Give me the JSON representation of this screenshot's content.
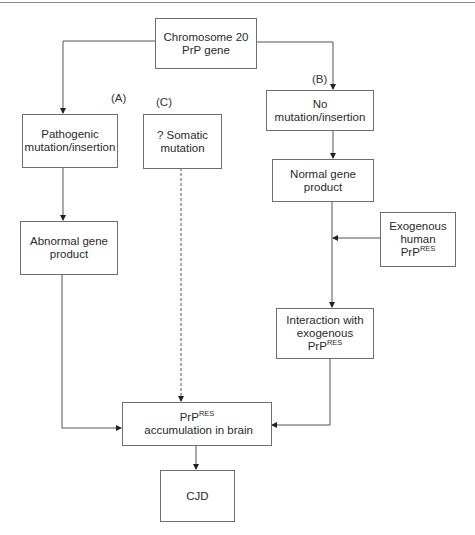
{
  "diagram": {
    "nodes": {
      "gene": {
        "line1": "Chromosome 20",
        "line2": "PrP gene"
      },
      "pathogenic": {
        "line1": "Pathogenic",
        "line2": "mutation/insertion"
      },
      "somatic": {
        "line1": "? Somatic",
        "line2": "mutation"
      },
      "no_mutation": {
        "line1": "No mutation/insertion"
      },
      "normal_product": {
        "line1": "Normal gene product"
      },
      "exogenous": {
        "line1": "Exogenous",
        "line2_prefix": "human PrP",
        "line2_sup": "RES"
      },
      "abnormal_product": {
        "line1": "Abnormal gene",
        "line2": "product"
      },
      "interaction": {
        "line1": "Interaction with",
        "line2_prefix": "exogenous PrP",
        "line2_sup": "RES"
      },
      "accumulation": {
        "prefix": "PrP",
        "sup": "RES",
        "suffix": " accumulation in brain"
      },
      "cjd": {
        "line1": "CJD"
      }
    },
    "path_labels": {
      "a": "(A)",
      "b": "(B)",
      "c": "(C)"
    },
    "edges": [
      {
        "from": "gene",
        "to": "pathogenic",
        "style": "solid"
      },
      {
        "from": "gene",
        "to": "no_mutation",
        "style": "solid"
      },
      {
        "from": "pathogenic",
        "to": "abnormal_product",
        "style": "solid"
      },
      {
        "from": "no_mutation",
        "to": "normal_product",
        "style": "solid"
      },
      {
        "from": "exogenous",
        "to": "normal_product->interaction",
        "style": "solid"
      },
      {
        "from": "normal_product",
        "to": "interaction",
        "style": "solid"
      },
      {
        "from": "abnormal_product",
        "to": "accumulation",
        "style": "solid"
      },
      {
        "from": "somatic",
        "to": "accumulation",
        "style": "dashed"
      },
      {
        "from": "interaction",
        "to": "accumulation",
        "style": "solid"
      },
      {
        "from": "accumulation",
        "to": "cjd",
        "style": "solid"
      }
    ],
    "colors": {
      "line": "#555555",
      "border": "#6e6e6e",
      "text": "#2a2a2a"
    }
  }
}
